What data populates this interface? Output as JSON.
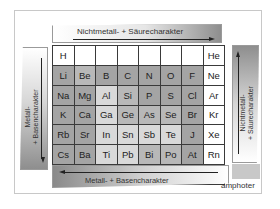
{
  "diagram": {
    "type": "periodic-table-trends",
    "arrows": {
      "top": {
        "label": "Nichtmetall- + Säurecharakter",
        "direction": "right"
      },
      "right": {
        "label_line1": "Nichtmetall-",
        "label_line2": "+ Säurecharakter",
        "direction": "up"
      },
      "bottom": {
        "label": "Metall- + Basencharakter",
        "direction": "left"
      },
      "left": {
        "label_line1": "Metall-",
        "label_line2": "+ Basencharakter",
        "direction": "down"
      }
    },
    "legend": {
      "amphoter_label": "amphoter",
      "amphoter_color": "#c8c8c8"
    },
    "rows": [
      [
        {
          "s": "H",
          "shade": "w"
        },
        {
          "s": "",
          "shade": "w"
        },
        {
          "s": "",
          "shade": "w"
        },
        {
          "s": "",
          "shade": "w"
        },
        {
          "s": "",
          "shade": "w"
        },
        {
          "s": "",
          "shade": "w"
        },
        {
          "s": "",
          "shade": "w"
        },
        {
          "s": "He",
          "shade": "w"
        }
      ],
      [
        {
          "s": "Li",
          "shade": "d"
        },
        {
          "s": "Be",
          "shade": "m"
        },
        {
          "s": "B",
          "shade": "d"
        },
        {
          "s": "C",
          "shade": "d"
        },
        {
          "s": "N",
          "shade": "d"
        },
        {
          "s": "O",
          "shade": "d"
        },
        {
          "s": "F",
          "shade": "d"
        },
        {
          "s": "Ne",
          "shade": "w"
        }
      ],
      [
        {
          "s": "Na",
          "shade": "d"
        },
        {
          "s": "Mg",
          "shade": "d"
        },
        {
          "s": "Al",
          "shade": "l"
        },
        {
          "s": "Si",
          "shade": "m"
        },
        {
          "s": "P",
          "shade": "d"
        },
        {
          "s": "S",
          "shade": "d"
        },
        {
          "s": "Cl",
          "shade": "d"
        },
        {
          "s": "Ar",
          "shade": "w"
        }
      ],
      [
        {
          "s": "K",
          "shade": "d"
        },
        {
          "s": "Ca",
          "shade": "d"
        },
        {
          "s": "Ga",
          "shade": "l"
        },
        {
          "s": "Ge",
          "shade": "m"
        },
        {
          "s": "As",
          "shade": "m"
        },
        {
          "s": "Se",
          "shade": "m"
        },
        {
          "s": "Br",
          "shade": "d"
        },
        {
          "s": "Kr",
          "shade": "w"
        }
      ],
      [
        {
          "s": "Rb",
          "shade": "d"
        },
        {
          "s": "Sr",
          "shade": "d"
        },
        {
          "s": "In",
          "shade": "l"
        },
        {
          "s": "Sn",
          "shade": "l"
        },
        {
          "s": "Sb",
          "shade": "l"
        },
        {
          "s": "Te",
          "shade": "l"
        },
        {
          "s": "J",
          "shade": "d"
        },
        {
          "s": "Xe",
          "shade": "w"
        }
      ],
      [
        {
          "s": "Cs",
          "shade": "d"
        },
        {
          "s": "Ba",
          "shade": "d"
        },
        {
          "s": "Ti",
          "shade": "l"
        },
        {
          "s": "Pb",
          "shade": "l"
        },
        {
          "s": "Bi",
          "shade": "m"
        },
        {
          "s": "Po",
          "shade": "m"
        },
        {
          "s": "At",
          "shade": "d"
        },
        {
          "s": "Rn",
          "shade": "w"
        }
      ],
      [
        {
          "s": "Fr",
          "shade": "d"
        },
        {
          "s": "Ra",
          "shade": "d"
        },
        {
          "s": "",
          "shade": "m"
        },
        {
          "s": "",
          "shade": "l"
        },
        {
          "s": "",
          "shade": "m"
        },
        {
          "s": "",
          "shade": "x"
        },
        {
          "s": "",
          "shade": "m"
        },
        {
          "s": "",
          "shade": "w"
        }
      ]
    ]
  }
}
